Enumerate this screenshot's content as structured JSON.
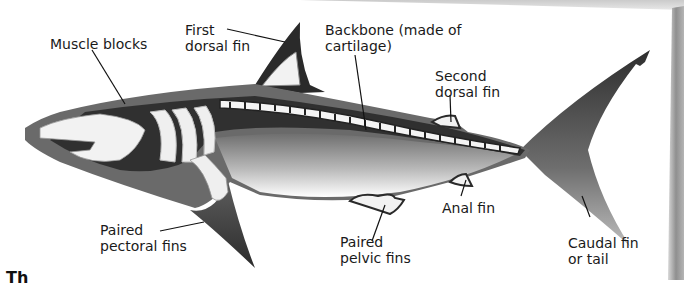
{
  "diagram": {
    "labels": {
      "muscle_blocks": "Muscle blocks",
      "first_dorsal_fin": "First\ndorsal fin",
      "backbone": "Backbone (made of\ncartilage)",
      "second_dorsal_fin": "Second\ndorsal fin",
      "paired_pectoral_fins": "Paired\npectoral fins",
      "paired_pelvic_fins": "Paired\npelvic fins",
      "anal_fin": "Anal fin",
      "caudal_fin": "Caudal fin\nor tail"
    },
    "caption_fragment": "Th"
  },
  "colors": {
    "background": "#ffffff",
    "outer_skin": "#6a6a6a",
    "dark_fill": "#2a2a2a",
    "cartilage": "#f2f2f2",
    "body_gradient_top": "#7a7a7a",
    "body_gradient_bottom": "#f5f5f5",
    "text": "#1a1a1a",
    "page_shadow": "#9a9a9a"
  }
}
